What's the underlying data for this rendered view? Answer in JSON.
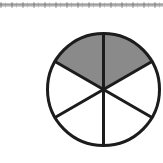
{
  "page": {
    "width": 163,
    "height": 163,
    "background_color": "#ffffff"
  },
  "scan_artifact": {
    "name": "scan-rule",
    "visible": true,
    "color": "#9a9a9a",
    "y": 3,
    "height": 4
  },
  "chart_data": {
    "type": "pie",
    "title": "",
    "subtitle": "",
    "xlabel": "",
    "ylabel": "",
    "legend": [],
    "grid": false,
    "categories": [
      "sector-1",
      "sector-2",
      "sector-3",
      "sector-4",
      "sector-5",
      "sector-6"
    ],
    "values": [
      1,
      1,
      1,
      1,
      1,
      1
    ],
    "total_parts": 6,
    "shaded_parts": 2,
    "fraction_numerator": 2,
    "fraction_denominator": 6,
    "fraction_label": "2/6",
    "slice_angle_degrees": 60,
    "shaded_indices": [
      0,
      1
    ],
    "shaded_start_angle_degrees": 30,
    "shaded_end_angle_degrees": 150,
    "shaded_color": "#8a8a8a",
    "unshaded_color": "#ffffff",
    "outline_color": "#1c1c1c",
    "annotations": []
  },
  "figure": {
    "name": "fraction-circle",
    "center_x": 103.5,
    "center_y": 89.5,
    "radius": 56,
    "outline_width": 3,
    "divider_width": 3,
    "divider_angles_degrees": [
      30,
      90,
      150,
      210,
      270,
      330
    ]
  }
}
